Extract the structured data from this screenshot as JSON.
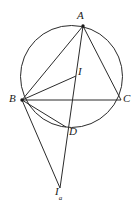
{
  "figure": {
    "stroke_color": "#2b2b2b",
    "background_color": "#ffffff",
    "label_color": "#1a1a1a",
    "stroke_width": 1,
    "width": 135,
    "height": 213
  },
  "circle": {
    "name": "circumcircle",
    "cx": 71.5,
    "cy": 76.5,
    "r": 51
  },
  "points": [
    {
      "id": "A",
      "label": "A",
      "x": 83,
      "y": 26,
      "dot": true,
      "on_circle": true
    },
    {
      "id": "B",
      "label": "B",
      "x": 22,
      "y": 100,
      "dot": true,
      "on_circle": true
    },
    {
      "id": "C",
      "label": "C",
      "x": 121,
      "y": 100,
      "dot": false,
      "on_circle": true
    },
    {
      "id": "I",
      "label": "I",
      "x": 76,
      "y": 76,
      "dot": false,
      "on_circle": false
    },
    {
      "id": "D",
      "label": "D",
      "x": 66,
      "y": 127,
      "dot": false,
      "on_circle": true
    },
    {
      "id": "Ia",
      "label": "I",
      "sublabel": "a",
      "x": 60,
      "y": 188,
      "dot": false,
      "on_circle": false
    }
  ],
  "segments": [
    {
      "name": "segment-AB",
      "from": "A",
      "to": "B"
    },
    {
      "name": "segment-AC",
      "from": "A",
      "to": "C"
    },
    {
      "name": "segment-BC",
      "from": "B",
      "to": "C"
    },
    {
      "name": "segment-BI",
      "from": "B",
      "to": "I"
    },
    {
      "name": "segment-BD",
      "from": "B",
      "to": "D"
    },
    {
      "name": "segment-A-Ia",
      "from": "A",
      "to": "Ia"
    },
    {
      "name": "segment-B-Ia",
      "from": "B",
      "to": "Ia"
    }
  ],
  "labels": {
    "A": "A",
    "B": "B",
    "C": "C",
    "I": "I",
    "D": "D",
    "Ia_base": "I",
    "Ia_sub": "a"
  }
}
